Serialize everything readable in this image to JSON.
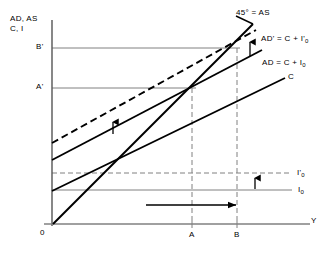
{
  "figure": {
    "background_color": "#ffffff",
    "line_color": "#000000",
    "guide_color": "#808080"
  },
  "axes": {
    "vertical_caption_line1": "AD, AS",
    "vertical_caption_line2": "C, I",
    "horizontal_label": "Y",
    "origin_label": "0"
  },
  "ticks": {
    "y": [
      {
        "label": "B'",
        "value_y": 48
      },
      {
        "label": "A'",
        "value_y": 88
      }
    ],
    "x": [
      {
        "label": "A",
        "value_x": 192
      },
      {
        "label": "B",
        "value_x": 237
      }
    ]
  },
  "curves": [
    {
      "name": "as-45-degree-line",
      "label": "45° = AS",
      "style": "solid"
    },
    {
      "name": "ad-prime-curve",
      "label": "AD' = C + I'",
      "label_sub": "0",
      "style": "dashed"
    },
    {
      "name": "ad-curve",
      "label": "AD = C + I",
      "label_sub": "0",
      "style": "solid"
    },
    {
      "name": "consumption-curve",
      "label": "C",
      "style": "solid"
    }
  ],
  "investment_lines": [
    {
      "name": "investment-prime-line",
      "label": "I'",
      "label_sub": "0",
      "style": "dashed",
      "y": 173
    },
    {
      "name": "investment-line",
      "label": "I",
      "label_sub": "0",
      "style": "solid",
      "y": 190
    }
  ],
  "annotations": {
    "arrow_investment_shift": "upward arrow showing increase in autonomous investment",
    "arrow_ad_shift_lower": "upward arrow showing shift of AD schedule",
    "arrow_ad_shift_upper": "upward arrow showing shift of AD schedule at equilibrium",
    "arrow_output_expansion": "rightward arrow showing expansion of output from A to B"
  }
}
